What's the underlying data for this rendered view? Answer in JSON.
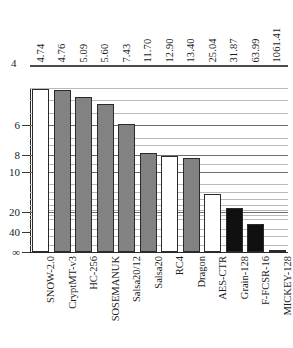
{
  "chart_data": {
    "type": "bar",
    "title": "",
    "subtitle": "",
    "xlabel": "",
    "ylabel": "",
    "grid": true,
    "legend_position": "none",
    "axis_scale": "log-inverted",
    "y_axis_note": "Axis increases downward; smaller value = taller bar",
    "ytick_labels": [
      "4",
      "6",
      "8",
      "10",
      "20",
      "40",
      "∞"
    ],
    "ytick_values": [
      4,
      6,
      8,
      10,
      20,
      40,
      null
    ],
    "ylim": [
      4,
      1100
    ],
    "categories": [
      "SNOW-2.0",
      "CryptMT-v3",
      "HC-256",
      "SOSEMANUK",
      "Salsa20/12",
      "Salsa20",
      "RC4",
      "Dragon",
      "AES-CTR",
      "Grain-128",
      "F-FCSR-16",
      "MICKEY-128"
    ],
    "values": [
      4.74,
      4.76,
      5.09,
      5.6,
      7.43,
      11.7,
      12.9,
      13.4,
      25.04,
      31.87,
      63.99,
      1061.41
    ],
    "value_labels": [
      "4.74",
      "4.76",
      "5.09",
      "5.60",
      "7.43",
      "11.70",
      "12.90",
      "13.40",
      "25.04",
      "31.87",
      "63.99",
      "1061.41"
    ],
    "bar_fills": [
      "white",
      "gray",
      "gray",
      "gray",
      "gray",
      "gray",
      "white",
      "gray",
      "white",
      "black",
      "black",
      "black"
    ],
    "bar_heights_px": [
      163,
      162,
      155,
      148,
      128,
      99,
      96,
      94,
      58,
      44,
      28,
      2
    ],
    "colors": {
      "bar_white": "#ffffff",
      "bar_gray": "#828282",
      "bar_black": "#101010",
      "bar_outline": "#2b2b2b",
      "gridline_minor": "#b9b9b9",
      "gridline_major": "#6d6d6d",
      "axis": "#2a2a2a",
      "top_rule": "#4a4a4a",
      "text": "#1b1b1b",
      "background": "#ffffff"
    },
    "gridlines_px": [
      {
        "y": 0,
        "major": false
      },
      {
        "y": 12,
        "major": false
      },
      {
        "y": 25,
        "major": false
      },
      {
        "y": 37,
        "major": true
      },
      {
        "y": 50,
        "major": false
      },
      {
        "y": 57,
        "major": false
      },
      {
        "y": 67,
        "major": true
      },
      {
        "y": 76,
        "major": false
      },
      {
        "y": 84,
        "major": true
      },
      {
        "y": 96,
        "major": false
      },
      {
        "y": 104,
        "major": false
      },
      {
        "y": 111,
        "major": false
      },
      {
        "y": 117,
        "major": false
      },
      {
        "y": 122,
        "major": false
      },
      {
        "y": 127,
        "major": false
      },
      {
        "y": 131,
        "major": false
      },
      {
        "y": 124,
        "major": true
      },
      {
        "y": 141,
        "major": false
      },
      {
        "y": 148,
        "major": false
      },
      {
        "y": 157,
        "major": false
      }
    ],
    "yticks_px": [
      {
        "label": "6",
        "y": 125
      },
      {
        "label": "8",
        "y": 155
      },
      {
        "label": "10",
        "y": 172
      },
      {
        "label": "20",
        "y": 212
      },
      {
        "label": "40",
        "y": 232
      },
      {
        "label": "∞",
        "y": 252
      }
    ],
    "top_rule_label": "4"
  }
}
